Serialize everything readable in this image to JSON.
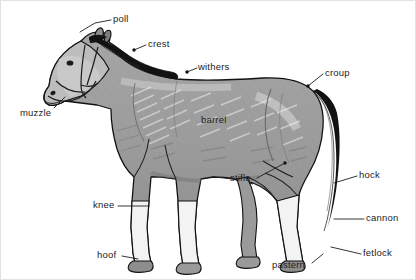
{
  "figure": {
    "style": "grayscale line illustration with leader lines",
    "background_color": "#ffffff",
    "border_color": "#e2e2e2",
    "label_text_color": "#1d1d1d",
    "leader_line_color": "#1d1d1d",
    "body_fill_color": "#9a9a9a",
    "body_shade_color": "#7c7c7c",
    "body_highlight_color": "#c9c9c9",
    "mane_tail_color": "#111111",
    "hoof_color": "#8e8e8e",
    "outline_color": "#111111"
  },
  "labels": [
    {
      "id": "poll",
      "text": "poll",
      "x": 112,
      "y": 13
    },
    {
      "id": "crest",
      "text": "crest",
      "x": 147,
      "y": 38
    },
    {
      "id": "withers",
      "text": "withers",
      "x": 197,
      "y": 61
    },
    {
      "id": "croup",
      "text": "croup",
      "x": 324,
      "y": 67
    },
    {
      "id": "muzzle",
      "text": "muzzle",
      "x": 19,
      "y": 107
    },
    {
      "id": "barrel",
      "text": "barrel",
      "x": 200,
      "y": 114
    },
    {
      "id": "stifle",
      "text": "stifle",
      "x": 229,
      "y": 172
    },
    {
      "id": "hock",
      "text": "hock",
      "x": 358,
      "y": 169
    },
    {
      "id": "knee",
      "text": "knee",
      "x": 92,
      "y": 199
    },
    {
      "id": "cannon",
      "text": "cannon",
      "x": 365,
      "y": 212
    },
    {
      "id": "fetlock",
      "text": "fetlock",
      "x": 362,
      "y": 247
    },
    {
      "id": "hoof",
      "text": "hoof",
      "x": 96,
      "y": 249
    },
    {
      "id": "pastern",
      "text": "pastern",
      "x": 271,
      "y": 259
    }
  ],
  "leader_lines": [
    {
      "id": "poll",
      "points": "110,19 94,22 79,31"
    },
    {
      "id": "crest",
      "points": "145,44 133,49"
    },
    {
      "id": "withers",
      "points": "196,67 186,71"
    },
    {
      "id": "croup",
      "points": "322,73 307,85"
    },
    {
      "id": "muzzle",
      "points": "53,107 64,96"
    },
    {
      "id": "stifle",
      "points": "256,177 284,162"
    },
    {
      "id": "hock",
      "points": "356,175 333,182"
    },
    {
      "id": "knee",
      "points": "117,205 148,205"
    },
    {
      "id": "cannon",
      "points": "363,218 333,218"
    },
    {
      "id": "fetlock",
      "points": "360,253 330,246"
    },
    {
      "id": "hoof",
      "points": "121,255 137,258"
    },
    {
      "id": "pastern",
      "points": "311,262 322,253"
    }
  ],
  "marker_dots": [
    {
      "id": "withers-dot",
      "cx": 186,
      "cy": 71
    },
    {
      "id": "croup-dot",
      "cx": 307,
      "cy": 85
    },
    {
      "id": "stifle-dot",
      "cx": 284,
      "cy": 162
    },
    {
      "id": "crest-dot",
      "cx": 133,
      "cy": 49
    }
  ]
}
